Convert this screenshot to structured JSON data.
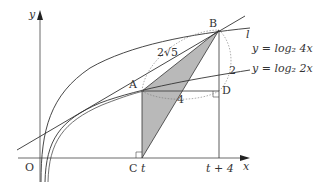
{
  "diagram": {
    "axes": {
      "x_label": "x",
      "y_label": "y",
      "origin_label": "O"
    },
    "points": {
      "A": "A",
      "B": "B",
      "C": "C",
      "D": "D"
    },
    "x_ticks": {
      "t": "t",
      "t_plus_4": "t + 4"
    },
    "line_label": "l",
    "curves": [
      {
        "name": "upper",
        "label": "y = log₂ 4x"
      },
      {
        "name": "lower",
        "label": "y = log₂ 2x"
      }
    ],
    "annotations": {
      "AB_length": "2√5",
      "AD_length": "4",
      "BD_length": "2"
    },
    "colors": {
      "shade": "#b8b8b8",
      "stroke": "#333333"
    }
  }
}
